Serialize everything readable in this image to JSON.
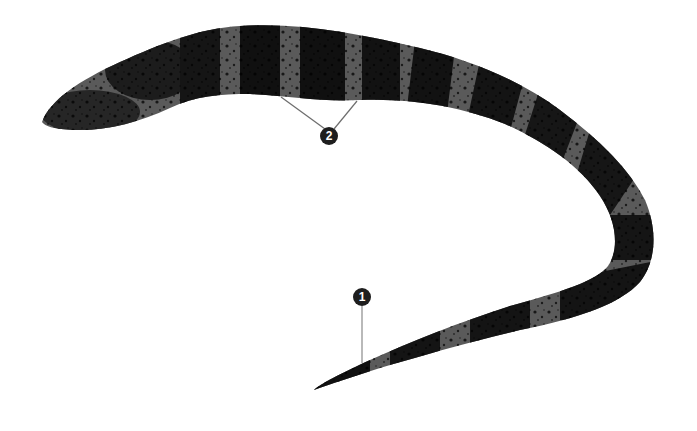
{
  "figure": {
    "background_color": "#ffffff",
    "body_color": "#141414",
    "band_color": "#5a5a5a",
    "leader_line_color": "#6e6e6e"
  },
  "callouts": [
    {
      "label": "1",
      "target": "tail-tip"
    },
    {
      "label": "2",
      "target": "body-bands"
    }
  ]
}
